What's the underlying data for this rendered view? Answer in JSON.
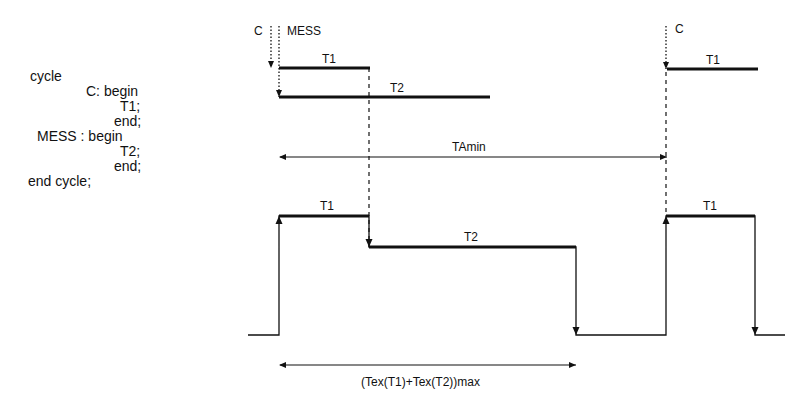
{
  "code": {
    "lines": [
      {
        "text": "cycle",
        "x": 30,
        "y": 77
      },
      {
        "text": "C: begin",
        "x": 86,
        "y": 92
      },
      {
        "text": "T1;",
        "x": 120,
        "y": 107
      },
      {
        "text": "end;",
        "x": 114,
        "y": 122
      },
      {
        "text": "MESS : begin",
        "x": 37,
        "y": 137
      },
      {
        "text": "T2;",
        "x": 120,
        "y": 152
      },
      {
        "text": "end;",
        "x": 114,
        "y": 167
      },
      {
        "text": "end cycle;",
        "x": 28,
        "y": 182
      }
    ]
  },
  "timeline": {
    "label_c_left": "C",
    "label_mess": "MESS",
    "label_c_right": "C",
    "task_t1_top": "T1",
    "task_t2_top": "T2",
    "task_t1_top_right": "T1",
    "tamin_label": "TAmin"
  },
  "waveform": {
    "label_t1_left": "T1",
    "label_t2": "T2",
    "label_t1_right": "T1",
    "duration_label": "(Tex(T1)+Tex(T2))max"
  }
}
